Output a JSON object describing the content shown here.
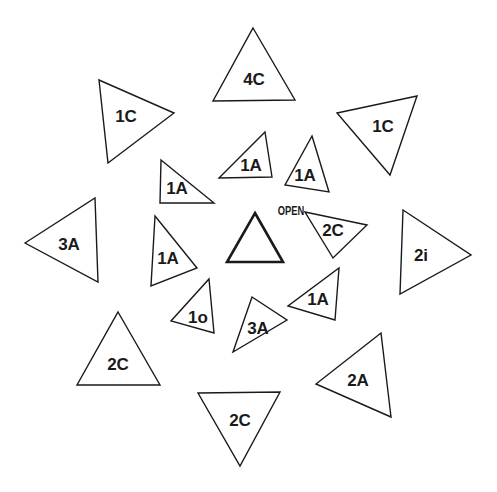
{
  "diagram": {
    "background": "#ffffff",
    "stroke_color": "#1a1a1a",
    "center": {
      "label": "OPEN",
      "points": [
        [
          255,
          213
        ],
        [
          283,
          262
        ],
        [
          227,
          262
        ]
      ],
      "text_pos": [
        255,
        247
      ]
    },
    "triangles": [
      {
        "label": "4C",
        "points": [
          [
            253,
            28
          ],
          [
            295,
            100
          ],
          [
            213,
            101
          ]
        ],
        "text_pos": [
          254,
          79
        ]
      },
      {
        "label": "1C",
        "points": [
          [
            99,
            80
          ],
          [
            174,
            113
          ],
          [
            108,
            163
          ]
        ],
        "text_pos": [
          126,
          116
        ]
      },
      {
        "label": "1C",
        "points": [
          [
            337,
            113
          ],
          [
            417,
            96
          ],
          [
            390,
            175
          ]
        ],
        "text_pos": [
          383,
          126
        ]
      },
      {
        "label": "1A",
        "points": [
          [
            161,
            160
          ],
          [
            214,
            203
          ],
          [
            160,
            203
          ]
        ],
        "text_pos": [
          177,
          188
        ]
      },
      {
        "label": "1A",
        "points": [
          [
            265,
            132
          ],
          [
            272,
            177
          ],
          [
            219,
            178
          ]
        ],
        "text_pos": [
          251,
          165
        ]
      },
      {
        "label": "1A",
        "points": [
          [
            312,
            136
          ],
          [
            329,
            192
          ],
          [
            285,
            185
          ]
        ],
        "text_pos": [
          305,
          175
        ]
      },
      {
        "label": "3A",
        "points": [
          [
            25,
            243
          ],
          [
            95,
            198
          ],
          [
            98,
            282
          ]
        ],
        "text_pos": [
          69,
          244
        ]
      },
      {
        "label": "1A",
        "points": [
          [
            155,
            216
          ],
          [
            197,
            268
          ],
          [
            151,
            286
          ]
        ],
        "text_pos": [
          168,
          258
        ]
      },
      {
        "label": "2C",
        "points": [
          [
            305,
            212
          ],
          [
            367,
            225
          ],
          [
            333,
            258
          ]
        ],
        "text_pos": [
          333,
          230
        ]
      },
      {
        "label": "2i",
        "points": [
          [
            403,
            210
          ],
          [
            471,
            255
          ],
          [
            400,
            294
          ]
        ],
        "text_pos": [
          421,
          255
        ]
      },
      {
        "label": "1o",
        "points": [
          [
            209,
            279
          ],
          [
            214,
            333
          ],
          [
            171,
            321
          ]
        ],
        "text_pos": [
          198,
          317
        ]
      },
      {
        "label": "3A",
        "points": [
          [
            252,
            297
          ],
          [
            287,
            320
          ],
          [
            233,
            352
          ]
        ],
        "text_pos": [
          258,
          328
        ]
      },
      {
        "label": "1A",
        "points": [
          [
            339,
            268
          ],
          [
            335,
            320
          ],
          [
            288,
            306
          ]
        ],
        "text_pos": [
          318,
          299
        ]
      },
      {
        "label": "2C",
        "points": [
          [
            118,
            312
          ],
          [
            160,
            385
          ],
          [
            77,
            385
          ]
        ],
        "text_pos": [
          118,
          364
        ]
      },
      {
        "label": "2A",
        "points": [
          [
            381,
            333
          ],
          [
            391,
            417
          ],
          [
            316,
            384
          ]
        ],
        "text_pos": [
          358,
          380
        ]
      },
      {
        "label": "2C",
        "points": [
          [
            198,
            393
          ],
          [
            280,
            392
          ],
          [
            240,
            466
          ]
        ],
        "text_pos": [
          240,
          420
        ]
      }
    ]
  }
}
